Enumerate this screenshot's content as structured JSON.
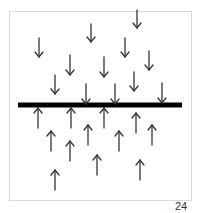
{
  "figure": {
    "page_number": "24",
    "colors": {
      "arrow": "#333333",
      "bar": "#000000",
      "frame": "#d8d8d8"
    },
    "bar": {
      "x1": 18,
      "x2": 182,
      "y": 105,
      "thickness": 5
    },
    "down_arrows": [
      {
        "x": 39,
        "y1": 38,
        "y2": 57
      },
      {
        "x": 70,
        "y1": 55,
        "y2": 75
      },
      {
        "x": 55,
        "y1": 75,
        "y2": 94
      },
      {
        "x": 91,
        "y1": 24,
        "y2": 42
      },
      {
        "x": 137,
        "y1": 10,
        "y2": 28
      },
      {
        "x": 125,
        "y1": 38,
        "y2": 57
      },
      {
        "x": 104,
        "y1": 57,
        "y2": 77
      },
      {
        "x": 149,
        "y1": 51,
        "y2": 70
      },
      {
        "x": 134,
        "y1": 72,
        "y2": 91
      },
      {
        "x": 86,
        "y1": 84,
        "y2": 104
      },
      {
        "x": 115,
        "y1": 84,
        "y2": 104
      },
      {
        "x": 162,
        "y1": 83,
        "y2": 103
      }
    ],
    "up_arrows": [
      {
        "x": 38,
        "y1": 108,
        "y2": 128
      },
      {
        "x": 71,
        "y1": 108,
        "y2": 128
      },
      {
        "x": 104,
        "y1": 108,
        "y2": 128
      },
      {
        "x": 136,
        "y1": 113,
        "y2": 133
      },
      {
        "x": 152,
        "y1": 125,
        "y2": 145
      },
      {
        "x": 51,
        "y1": 131,
        "y2": 151
      },
      {
        "x": 88,
        "y1": 125,
        "y2": 145
      },
      {
        "x": 119,
        "y1": 131,
        "y2": 151
      },
      {
        "x": 70,
        "y1": 141,
        "y2": 161
      },
      {
        "x": 97,
        "y1": 155,
        "y2": 175
      },
      {
        "x": 140,
        "y1": 160,
        "y2": 180
      },
      {
        "x": 55,
        "y1": 170,
        "y2": 190
      }
    ]
  }
}
